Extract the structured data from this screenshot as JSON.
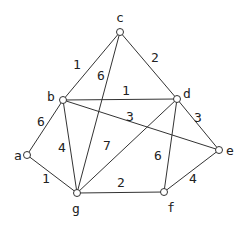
{
  "graph": {
    "type": "weighted-undirected-graph",
    "nodes": [
      {
        "id": "a",
        "label": "a",
        "x": 27,
        "y": 155,
        "lx": 14,
        "ly": 160
      },
      {
        "id": "b",
        "label": "b",
        "x": 63,
        "y": 100,
        "lx": 47,
        "ly": 101
      },
      {
        "id": "c",
        "label": "c",
        "x": 120,
        "y": 32,
        "lx": 116,
        "ly": 22
      },
      {
        "id": "d",
        "label": "d",
        "x": 177,
        "y": 99,
        "lx": 183,
        "ly": 98
      },
      {
        "id": "e",
        "label": "e",
        "x": 219,
        "y": 150,
        "lx": 226,
        "ly": 155
      },
      {
        "id": "f",
        "label": "f",
        "x": 164,
        "y": 192,
        "lx": 167,
        "ly": 212
      },
      {
        "id": "g",
        "label": "g",
        "x": 77,
        "y": 193,
        "lx": 72,
        "ly": 213
      }
    ],
    "edges": [
      {
        "from": "c",
        "to": "b",
        "weight": "1",
        "wx": 77,
        "wy": 69
      },
      {
        "from": "c",
        "to": "g",
        "weight": "6",
        "wx": 101,
        "wy": 80
      },
      {
        "from": "c",
        "to": "d",
        "weight": "2",
        "wx": 155,
        "wy": 62
      },
      {
        "from": "b",
        "to": "d",
        "weight": "1",
        "wx": 126,
        "wy": 95
      },
      {
        "from": "b",
        "to": "e",
        "weight": "3",
        "wx": 130,
        "wy": 121
      },
      {
        "from": "b",
        "to": "a",
        "weight": "6",
        "wx": 41,
        "wy": 126
      },
      {
        "from": "b",
        "to": "g",
        "weight": "4",
        "wx": 62,
        "wy": 152
      },
      {
        "from": "d",
        "to": "g",
        "weight": "7",
        "wx": 107,
        "wy": 150
      },
      {
        "from": "d",
        "to": "e",
        "weight": "3",
        "wx": 198,
        "wy": 122
      },
      {
        "from": "d",
        "to": "f",
        "weight": "6",
        "wx": 158,
        "wy": 160
      },
      {
        "from": "a",
        "to": "g",
        "weight": "1",
        "wx": 46,
        "wy": 183
      },
      {
        "from": "g",
        "to": "f",
        "weight": "2",
        "wx": 121,
        "wy": 187
      },
      {
        "from": "f",
        "to": "e",
        "weight": "4",
        "wx": 193,
        "wy": 183
      }
    ]
  }
}
